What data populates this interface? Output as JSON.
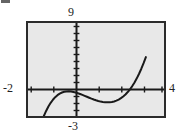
{
  "figure": {
    "width": 176,
    "height": 136,
    "outer_background": "#ffffff",
    "plot_background": "#e8e8e8",
    "frame_color": "#2b2b2b",
    "curve_color": "#1a1a1a",
    "artifact_name": "scan-artifact-mark"
  },
  "labels": {
    "ymax": "9",
    "ymin": "-3",
    "xmin": "-2",
    "xmax": "4"
  },
  "chart_data": {
    "type": "line",
    "title": "",
    "xlabel": "",
    "ylabel": "",
    "xlim": [
      -2,
      4
    ],
    "ylim": [
      -3,
      9
    ],
    "grid": false,
    "legend": null,
    "axes_style": "calculator-window",
    "x_tick_interval": 1,
    "y_tick_interval": 1,
    "x_ticks": [
      -2,
      -1,
      0,
      1,
      2,
      3,
      4
    ],
    "y_ticks": [
      -3,
      -2,
      -1,
      0,
      1,
      2,
      3,
      4,
      5,
      6,
      7,
      8,
      9
    ],
    "series": [
      {
        "name": "curve",
        "x": [
          -1.3,
          -1.2,
          -1.1,
          -1.0,
          -0.9,
          -0.8,
          -0.7,
          -0.6,
          -0.5,
          -0.4,
          -0.3,
          -0.2,
          -0.1,
          0.0,
          0.1,
          0.2,
          0.3,
          0.4,
          0.5,
          0.6,
          0.7,
          0.8,
          0.9,
          1.0,
          1.1,
          1.2,
          1.3,
          1.4,
          1.5,
          1.6,
          1.7,
          1.8,
          1.9,
          2.0,
          2.1,
          2.2,
          2.3,
          2.4,
          2.5,
          2.6,
          2.7,
          2.8,
          2.9,
          3.0,
          3.1,
          3.2
        ],
        "y": [
          -3.0,
          -2.35,
          -1.78,
          -1.3,
          -0.9,
          -0.57,
          -0.31,
          -0.11,
          0.03,
          0.12,
          0.17,
          0.18,
          0.15,
          0.1,
          0.03,
          -0.06,
          -0.16,
          -0.28,
          -0.4,
          -0.52,
          -0.64,
          -0.76,
          -0.87,
          -0.97,
          -1.06,
          -1.14,
          -1.19,
          -1.23,
          -1.24,
          -1.23,
          -1.19,
          -1.12,
          -1.02,
          -0.88,
          -0.7,
          -0.48,
          -0.22,
          0.09,
          0.45,
          0.86,
          1.33,
          1.86,
          2.45,
          3.1,
          3.82,
          4.6
        ],
        "x_axis_crossings": [
          -0.55,
          2.33
        ],
        "local_maximum": {
          "x": -0.18,
          "y": 0.18
        },
        "local_minimum": {
          "x": 1.5,
          "y": -1.24
        },
        "enters_bottom_at_x": -1.3,
        "exits_top_at_x": 3.6
      }
    ]
  }
}
